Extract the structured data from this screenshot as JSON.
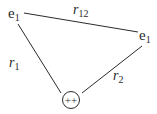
{
  "diagram": {
    "nodes": [
      {
        "id": "electron_1",
        "label": "e",
        "subscript": "1"
      },
      {
        "id": "electron_2",
        "label": "e",
        "subscript": "1"
      },
      {
        "id": "nucleus",
        "label": "++"
      }
    ],
    "edges": [
      {
        "from": "electron_1",
        "to": "electron_2",
        "label": "r",
        "subscript": "12"
      },
      {
        "from": "electron_1",
        "to": "nucleus",
        "label": "r",
        "subscript": "1"
      },
      {
        "from": "nucleus",
        "to": "electron_2",
        "label": "r",
        "subscript": "2"
      }
    ],
    "colors": {
      "line": "#2a2a2a",
      "background": "#ffffff"
    }
  }
}
